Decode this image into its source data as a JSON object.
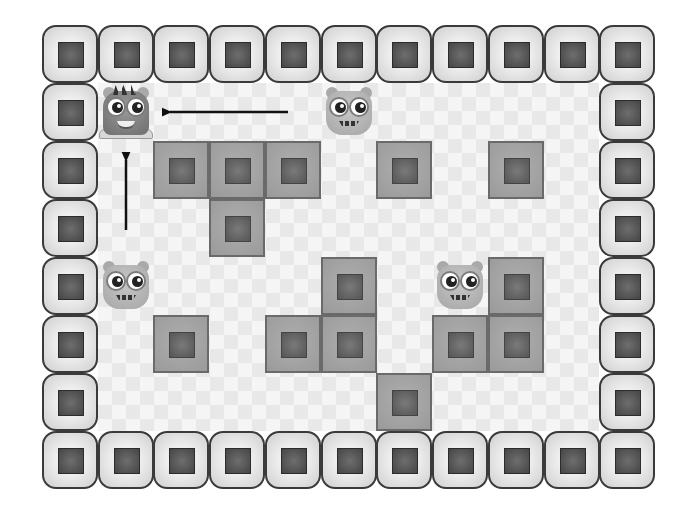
{
  "game": {
    "title": "Monster sliding puzzle",
    "grid": {
      "cols": 11,
      "rows": 8,
      "origin_x": 42,
      "origin_y": 25,
      "cell_w": 55.73,
      "cell_h": 58
    },
    "colors": {
      "wall_border": "#3a3a3a",
      "wall_fill": "#e4e4e4",
      "block_fill": "#a3a3a3",
      "block_core": "#5f5f5f",
      "floor": "#f4f4f4",
      "arrow": "#111111"
    },
    "blocks": [
      {
        "row": 2,
        "col": 2
      },
      {
        "row": 2,
        "col": 3
      },
      {
        "row": 2,
        "col": 4
      },
      {
        "row": 2,
        "col": 6
      },
      {
        "row": 2,
        "col": 8
      },
      {
        "row": 3,
        "col": 3
      },
      {
        "row": 4,
        "col": 5
      },
      {
        "row": 4,
        "col": 8
      },
      {
        "row": 5,
        "col": 2
      },
      {
        "row": 5,
        "col": 4
      },
      {
        "row": 5,
        "col": 5
      },
      {
        "row": 5,
        "col": 7
      },
      {
        "row": 5,
        "col": 8
      },
      {
        "row": 6,
        "col": 6
      }
    ],
    "player": {
      "row": 1,
      "col": 1,
      "icon": "player-monster-icon"
    },
    "monsters": [
      {
        "row": 1,
        "col": 5,
        "icon": "monster-icon"
      },
      {
        "row": 4,
        "col": 1,
        "icon": "monster-icon"
      },
      {
        "row": 4,
        "col": 7,
        "icon": "monster-icon"
      }
    ],
    "arrows": [
      {
        "name": "arrow-left-icon",
        "x1": 288,
        "y1": 112,
        "x2": 170,
        "y2": 112,
        "direction": "left"
      },
      {
        "name": "arrow-up-icon",
        "x1": 126,
        "y1": 230,
        "x2": 126,
        "y2": 160,
        "direction": "up"
      }
    ]
  }
}
